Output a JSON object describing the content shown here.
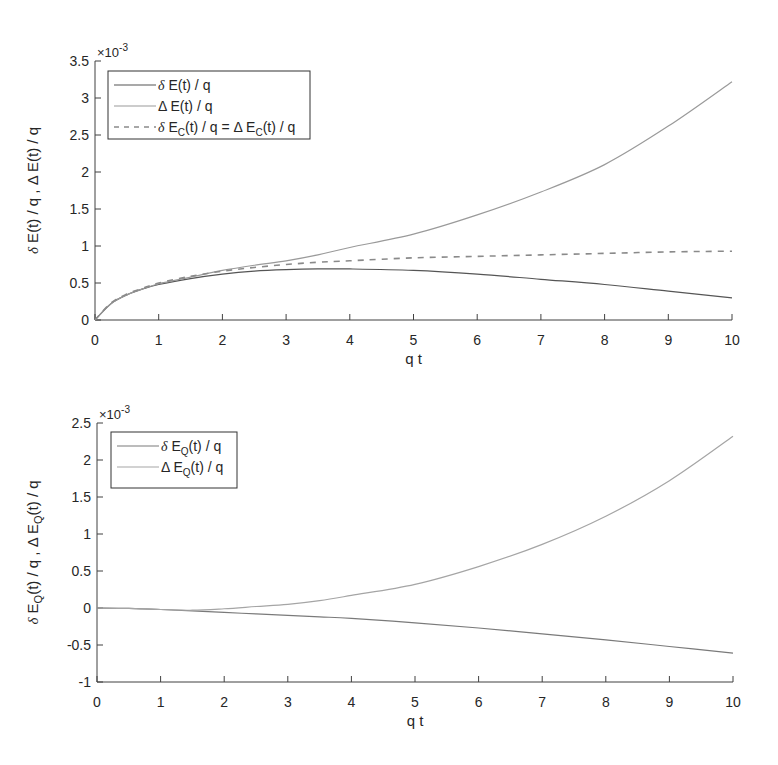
{
  "chart_data": [
    {
      "type": "line",
      "xlabel": "q t",
      "ylabel": "δ E(t) / q , Δ E(t) / q",
      "y_exponent": "×10^-3",
      "xlim": [
        0,
        10
      ],
      "ylim": [
        0,
        3.5
      ],
      "xticks": [
        "0",
        "1",
        "2",
        "3",
        "4",
        "5",
        "6",
        "7",
        "8",
        "9",
        "10"
      ],
      "yticks": [
        "0",
        "0.5",
        "1",
        "1.5",
        "2",
        "2.5",
        "3",
        "3.5"
      ],
      "grid": false,
      "legend_position": "upper left",
      "x": [
        0,
        0.25,
        0.5,
        0.75,
        1,
        1.5,
        2,
        2.5,
        3,
        3.5,
        4,
        5,
        6,
        7,
        8,
        9,
        10
      ],
      "series": [
        {
          "name": "δ E(t) / q",
          "style": "solid",
          "color": "#555555",
          "values": [
            0,
            0.22,
            0.34,
            0.42,
            0.48,
            0.56,
            0.62,
            0.66,
            0.68,
            0.69,
            0.69,
            0.67,
            0.62,
            0.55,
            0.48,
            0.39,
            0.3
          ]
        },
        {
          "name": "Δ E(t) / q",
          "style": "solid",
          "color": "#9a9a9a",
          "values": [
            0,
            0.22,
            0.34,
            0.42,
            0.49,
            0.58,
            0.67,
            0.74,
            0.8,
            0.88,
            0.98,
            1.16,
            1.42,
            1.73,
            2.1,
            2.62,
            3.22
          ]
        },
        {
          "name": "δ E_C(t) / q = Δ E_C(t) / q",
          "style": "dashed",
          "color": "#8a8a8a",
          "values": [
            0,
            0.23,
            0.35,
            0.43,
            0.5,
            0.59,
            0.66,
            0.71,
            0.75,
            0.78,
            0.8,
            0.84,
            0.86,
            0.88,
            0.9,
            0.92,
            0.93
          ]
        }
      ]
    },
    {
      "type": "line",
      "xlabel": "q t",
      "ylabel": "δ E_Q(t) / q , Δ E_Q(t) / q",
      "y_exponent": "×10^-3",
      "xlim": [
        0,
        10
      ],
      "ylim": [
        -1,
        2.5
      ],
      "xticks": [
        "0",
        "1",
        "2",
        "3",
        "4",
        "5",
        "6",
        "7",
        "8",
        "9",
        "10"
      ],
      "yticks": [
        "-1",
        "-0.5",
        "0",
        "0.5",
        "1",
        "1.5",
        "2",
        "2.5"
      ],
      "grid": false,
      "legend_position": "upper left",
      "x": [
        0,
        0.5,
        1,
        1.5,
        2,
        2.5,
        3,
        3.5,
        4,
        5,
        6,
        7,
        8,
        9,
        10
      ],
      "series": [
        {
          "name": "δ E_Q(t) / q",
          "style": "solid",
          "color": "#7a7a7a",
          "values": [
            0,
            -0.005,
            -0.02,
            -0.04,
            -0.06,
            -0.08,
            -0.1,
            -0.12,
            -0.14,
            -0.2,
            -0.27,
            -0.35,
            -0.43,
            -0.52,
            -0.61
          ]
        },
        {
          "name": "Δ E_Q(t) / q",
          "style": "solid",
          "color": "#a5a5a5",
          "values": [
            0,
            -0.005,
            -0.02,
            -0.03,
            -0.01,
            0.02,
            0.05,
            0.1,
            0.17,
            0.32,
            0.56,
            0.86,
            1.24,
            1.72,
            2.32
          ]
        }
      ]
    }
  ],
  "plots": [
    {
      "xlabel": "q t",
      "exp_base": "×10",
      "exp_power": "-3",
      "ylabel_parts": [
        "δ",
        " E(t) / q , ",
        "Δ",
        " E(t) / q"
      ],
      "legend": [
        {
          "greek": "δ",
          "rest": " E(t) / q"
        },
        {
          "greek": "Δ",
          "rest": " E(t) / q"
        },
        {
          "greek": "δ",
          "rest": " E",
          "sub": "C",
          "rest2": "(t) / q = Δ E",
          "sub2": "C",
          "rest3": "(t) / q"
        }
      ]
    },
    {
      "xlabel": "q t",
      "exp_base": "×10",
      "exp_power": "-3",
      "legend": [
        {
          "greek": "δ",
          "rest": " E",
          "sub": "Q",
          "rest2": "(t) / q"
        },
        {
          "greek": "Δ",
          "rest": " E",
          "sub": "Q",
          "rest2": "(t) / q"
        }
      ]
    }
  ]
}
